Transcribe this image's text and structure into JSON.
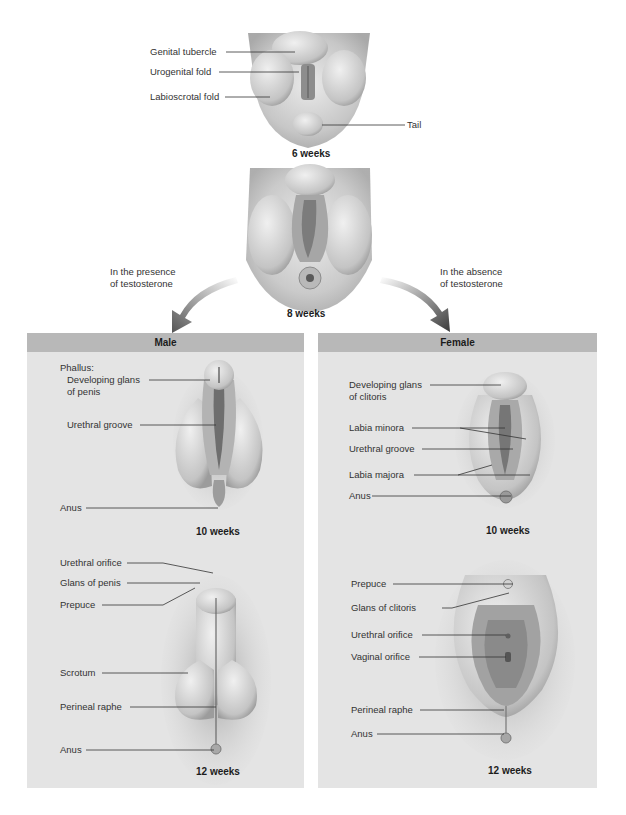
{
  "stages": {
    "six_weeks": {
      "caption": "6 weeks",
      "labels": [
        "Genital tubercle",
        "Urogenital fold",
        "Labioscrotal fold",
        "Tail"
      ]
    },
    "eight_weeks": {
      "caption": "8 weeks"
    },
    "branch_left": {
      "line1": "In the presence",
      "line2": "of testosterone"
    },
    "branch_right": {
      "line1": "In the absence",
      "line2": "of testosterone"
    }
  },
  "male": {
    "title": "Male",
    "ten_weeks": {
      "caption": "10 weeks",
      "phallus": "Phallus:",
      "labels": [
        "Developing glans",
        "of penis",
        "Urethral groove",
        "Anus"
      ]
    },
    "twelve_weeks": {
      "caption": "12 weeks",
      "labels": [
        "Urethral orifice",
        "Glans of penis",
        "Prepuce",
        "Scrotum",
        "Perineal raphe",
        "Anus"
      ]
    }
  },
  "female": {
    "title": "Female",
    "ten_weeks": {
      "caption": "10 weeks",
      "labels": [
        "Developing glans",
        "of clitoris",
        "Labia minora",
        "Urethral groove",
        "Labia majora",
        "Anus"
      ]
    },
    "twelve_weeks": {
      "caption": "12 weeks",
      "labels": [
        "Prepuce",
        "Glans of clitoris",
        "Urethral orifice",
        "Vaginal orifice",
        "Perineal raphe",
        "Anus"
      ]
    }
  },
  "colors": {
    "panel_bg": "#e4e4e4",
    "panel_header": "#b8b8b8",
    "tissue_light": "#d6d6d6",
    "tissue_dark": "#8a8a8a",
    "arrow": "#5a5a5a"
  }
}
